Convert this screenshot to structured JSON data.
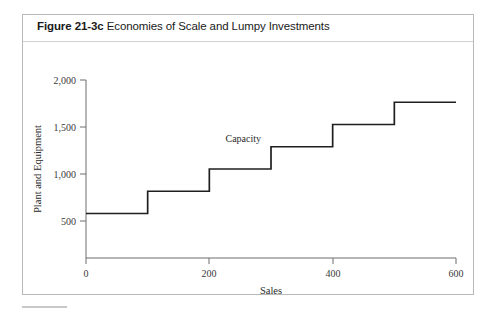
{
  "figure": {
    "number": "Figure 21-3c",
    "caption": "Economies of Scale and Lumpy Investments"
  },
  "chart_data": {
    "type": "line",
    "title": "Economies of Scale and Lumpy Investments",
    "xlabel": "Sales",
    "ylabel": "Plant and Equipment",
    "xlim": [
      0,
      600
    ],
    "ylim": [
      0,
      2000
    ],
    "xticks": [
      0,
      200,
      400,
      600
    ],
    "xtick_labels": [
      "0",
      "200",
      "400",
      "600"
    ],
    "yticks": [
      500,
      1000,
      1500,
      2000
    ],
    "ytick_labels": [
      "500",
      "1,000",
      "1,500",
      "2,000"
    ],
    "grid": false,
    "legend": false,
    "series": [
      {
        "name": "Capacity",
        "style": "step",
        "steps": [
          {
            "x_start": 0,
            "x_end": 100,
            "y": 500
          },
          {
            "x_start": 100,
            "x_end": 200,
            "y": 750
          },
          {
            "x_start": 200,
            "x_end": 300,
            "y": 1000
          },
          {
            "x_start": 300,
            "x_end": 400,
            "y": 1250
          },
          {
            "x_start": 400,
            "x_end": 500,
            "y": 1500
          },
          {
            "x_start": 500,
            "x_end": 600,
            "y": 1750
          }
        ]
      }
    ],
    "annotations": [
      {
        "text": "Capacity",
        "x": 255,
        "y": 1300
      }
    ]
  },
  "colors": {
    "series_line": "#1f1f1f",
    "axis": "#6d6d6d",
    "border": "#b9b9b9",
    "text": "#1a1a1a"
  }
}
